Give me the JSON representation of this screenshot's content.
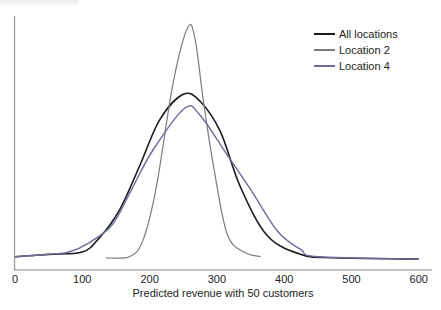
{
  "chart_data": {
    "type": "line",
    "title": "",
    "xlabel": "Predicted revenue with 50 customers",
    "ylabel": "",
    "xlim": [
      0,
      600
    ],
    "x_ticks": [
      "0",
      "100",
      "200",
      "300",
      "400",
      "500",
      "600"
    ],
    "y_ticks": [],
    "grid": false,
    "legend_position": "upper right",
    "series": [
      {
        "name": "All locations",
        "color": "#1a1a22",
        "width": 1.6,
        "points": [
          [
            0,
            0.01
          ],
          [
            50,
            0.02
          ],
          [
            100,
            0.03
          ],
          [
            125,
            0.09
          ],
          [
            155,
            0.21
          ],
          [
            185,
            0.4
          ],
          [
            215,
            0.6
          ],
          [
            250,
            0.71
          ],
          [
            275,
            0.68
          ],
          [
            305,
            0.55
          ],
          [
            335,
            0.31
          ],
          [
            375,
            0.1
          ],
          [
            425,
            0.02
          ],
          [
            475,
            0.005
          ],
          [
            600,
            0.0
          ]
        ]
      },
      {
        "name": "Location 2",
        "color": "#7a7a82",
        "width": 1.2,
        "points": [
          [
            135,
            0.005
          ],
          [
            170,
            0.01
          ],
          [
            190,
            0.08
          ],
          [
            210,
            0.31
          ],
          [
            235,
            0.76
          ],
          [
            257,
            1.0
          ],
          [
            268,
            0.94
          ],
          [
            280,
            0.68
          ],
          [
            295,
            0.4
          ],
          [
            315,
            0.11
          ],
          [
            340,
            0.03
          ],
          [
            365,
            0.01
          ]
        ]
      },
      {
        "name": "Location 4",
        "color": "#6a6e96",
        "width": 1.4,
        "points": [
          [
            0,
            0.01
          ],
          [
            50,
            0.02
          ],
          [
            80,
            0.03
          ],
          [
            110,
            0.07
          ],
          [
            145,
            0.15
          ],
          [
            175,
            0.31
          ],
          [
            205,
            0.47
          ],
          [
            252,
            0.65
          ],
          [
            275,
            0.62
          ],
          [
            315,
            0.45
          ],
          [
            350,
            0.3
          ],
          [
            390,
            0.12
          ],
          [
            425,
            0.04
          ],
          [
            450,
            0.01
          ],
          [
            600,
            0.0
          ]
        ]
      }
    ]
  },
  "axes": {
    "x_tick_labels": [
      "0",
      "100",
      "200",
      "300",
      "400",
      "500",
      "600"
    ],
    "x_title": "Predicted revenue with 50 customers"
  },
  "legend": {
    "items": [
      {
        "label": "All locations",
        "color": "#1a1a22"
      },
      {
        "label": "Location 2",
        "color": "#7a7a82"
      },
      {
        "label": "Location 4",
        "color": "#6a6e96"
      }
    ]
  }
}
